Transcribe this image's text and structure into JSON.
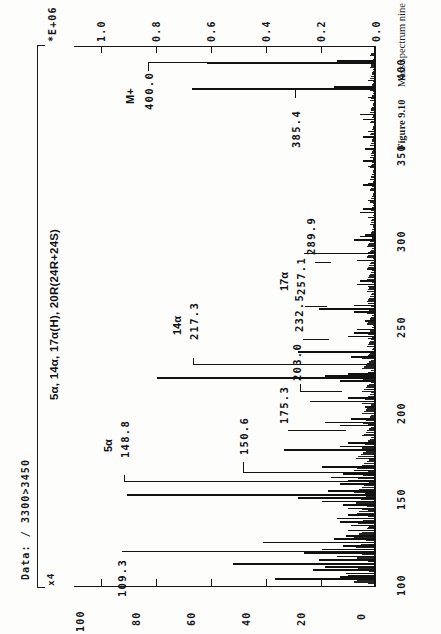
{
  "figure": {
    "data_header": "Data: / 3300>3450",
    "scale_marker": "x4",
    "compound_title": "5α, 14α, 17α(H), 20R(24R+24S)",
    "intensity_exponent": "*E+06",
    "caption_label": "Figure 9.10",
    "caption_text": "Mass spectrum nine under C, see Figure 9.1."
  },
  "axes": {
    "intensity": {
      "label": "*E+06",
      "ticks": [
        "1.0",
        "0.8",
        "0.6",
        "0.4",
        "0.2",
        "0.0"
      ]
    },
    "percent": {
      "ticks": [
        "100",
        "80",
        "60",
        "40",
        "20",
        "0"
      ]
    },
    "mz": {
      "ticks": [
        "100",
        "150",
        "200",
        "250",
        "300",
        "350",
        "400"
      ]
    }
  },
  "annotations": [
    {
      "mz": "109.3",
      "tag": ""
    },
    {
      "mz": "148.8",
      "tag": "5α"
    },
    {
      "mz": "150.6",
      "tag": ""
    },
    {
      "mz": "175.3",
      "tag": ""
    },
    {
      "mz": "203.0",
      "tag": ""
    },
    {
      "mz": "217.3",
      "tag": "14α"
    },
    {
      "mz": "232.5",
      "tag": ""
    },
    {
      "mz": "257.1",
      "tag": "17α"
    },
    {
      "mz": "289.9",
      "tag": ""
    },
    {
      "mz": "385.4",
      "tag": ""
    },
    {
      "mz": "400.0",
      "tag": "M+"
    }
  ],
  "chart_data": {
    "type": "bar",
    "title": "5α, 14α, 17α(H), 20R(24R+24S)",
    "xlabel": "m/z",
    "ylabel": "Relative abundance (%)",
    "y2label": "Intensity *E+06",
    "xlim": [
      95,
      410
    ],
    "ylim": [
      0,
      100
    ],
    "y2lim": [
      0.0,
      1.0
    ],
    "grid": false,
    "legend": null,
    "orientation": "rotated-90",
    "x": [
      100,
      101,
      102,
      103,
      105,
      107,
      109,
      111,
      113,
      115,
      117,
      119,
      121,
      123,
      125,
      128,
      131,
      133,
      135,
      137,
      141,
      143,
      145,
      147,
      149,
      151,
      155,
      157,
      159,
      161,
      163,
      165,
      175,
      177,
      179,
      189,
      191,
      193,
      203,
      205,
      215,
      217,
      218,
      219,
      229,
      232,
      241,
      243,
      245,
      255,
      257,
      259,
      271,
      273,
      285,
      289,
      297,
      299,
      313,
      315,
      329,
      343,
      357,
      367,
      370,
      385,
      386,
      400,
      401
    ],
    "y": [
      34,
      12,
      9,
      10,
      21,
      17,
      48,
      19,
      13,
      24,
      18,
      11,
      38,
      14,
      10,
      9,
      8,
      12,
      13,
      9,
      9,
      11,
      18,
      26,
      84,
      16,
      12,
      9,
      15,
      11,
      7,
      18,
      31,
      12,
      9,
      12,
      17,
      8,
      22,
      9,
      12,
      74,
      17,
      9,
      8,
      26,
      9,
      7,
      6,
      7,
      19,
      7,
      6,
      5,
      6,
      24,
      7,
      5,
      5,
      4,
      4,
      4,
      4,
      4,
      5,
      62,
      14,
      57,
      13
    ],
    "annotated_points": [
      {
        "mz": 109.3,
        "label": "109.3",
        "tag": ""
      },
      {
        "mz": 148.8,
        "label": "148.8",
        "tag": "5α"
      },
      {
        "mz": 150.6,
        "label": "150.6",
        "tag": ""
      },
      {
        "mz": 175.3,
        "label": "175.3",
        "tag": ""
      },
      {
        "mz": 203.0,
        "label": "203.0",
        "tag": ""
      },
      {
        "mz": 217.3,
        "label": "217.3",
        "tag": "14α"
      },
      {
        "mz": 232.5,
        "label": "232.5",
        "tag": ""
      },
      {
        "mz": 257.1,
        "label": "257.1",
        "tag": "17α"
      },
      {
        "mz": 289.9,
        "label": "289.9",
        "tag": ""
      },
      {
        "mz": 385.4,
        "label": "385.4",
        "tag": ""
      },
      {
        "mz": 400.0,
        "label": "400.0",
        "tag": "M+"
      }
    ]
  }
}
